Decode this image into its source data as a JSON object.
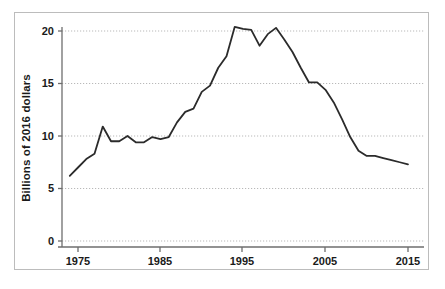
{
  "figure": {
    "frame_border_color": "#bcbcbc",
    "background_color": "#ffffff",
    "caption": ""
  },
  "axis": {
    "y_label": "Billions of 2016 dollars",
    "y_ticks": [
      "0",
      "5",
      "10",
      "15",
      "20"
    ],
    "x_ticks": [
      "1975",
      "1985",
      "1995",
      "2005",
      "2015"
    ]
  },
  "chart_data": {
    "type": "line",
    "title": "",
    "xlabel": "",
    "ylabel": "Billions of 2016 dollars",
    "xlim": [
      1974,
      2015
    ],
    "ylim": [
      0,
      21
    ],
    "xticks": [
      1975,
      1985,
      1995,
      2005,
      2015
    ],
    "yticks": [
      0,
      5,
      10,
      15,
      20
    ],
    "grid": true,
    "grid_color": "#b9b9b9",
    "grid_style": "dotted",
    "legend": null,
    "line_color": "#2b2b2b",
    "line_width": 1.8,
    "series": [
      {
        "name": "Billions of 2016 dollars",
        "x": [
          1974,
          1975,
          1976,
          1977,
          1978,
          1979,
          1980,
          1981,
          1982,
          1983,
          1984,
          1985,
          1986,
          1987,
          1988,
          1989,
          1990,
          1991,
          1992,
          1993,
          1994,
          1995,
          1996,
          1997,
          1998,
          1999,
          2000,
          2001,
          2002,
          2003,
          2004,
          2005,
          2006,
          2007,
          2008,
          2009,
          2010,
          2011,
          2012,
          2013,
          2014,
          2015
        ],
        "values": [
          6.2,
          7.0,
          7.8,
          8.3,
          10.9,
          9.5,
          9.5,
          10.0,
          9.4,
          9.4,
          9.9,
          9.7,
          9.9,
          11.3,
          12.3,
          12.6,
          14.2,
          14.8,
          16.5,
          17.6,
          20.4,
          20.2,
          20.1,
          18.6,
          19.7,
          20.3,
          19.2,
          18.0,
          16.5,
          15.1,
          15.1,
          14.4,
          13.2,
          11.6,
          9.9,
          8.6,
          8.1,
          8.1,
          7.9,
          7.7,
          7.5,
          7.3
        ]
      }
    ]
  }
}
